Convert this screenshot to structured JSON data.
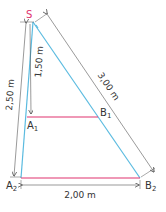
{
  "diagram": {
    "type": "similar-triangles-intercept-theorem",
    "points": {
      "S": {
        "label": "S",
        "x": 33,
        "y": 22
      },
      "A1": {
        "label": "A",
        "sub": "1",
        "x": 27,
        "y": 117
      },
      "B1": {
        "label": "B",
        "sub": "1",
        "x": 98,
        "y": 117
      },
      "A2": {
        "label": "A",
        "sub": "2",
        "x": 21,
        "y": 178
      },
      "B2": {
        "label": "B",
        "sub": "2",
        "x": 140,
        "y": 178
      }
    },
    "dimensions": {
      "SA2": "2,50 m",
      "SA1": "1,50 m",
      "SB2": "3,00 m",
      "A2B2": "2,00 m"
    },
    "colors": {
      "rays": "#5bbbe0",
      "parallels": "#e0336e",
      "label_S": "#e0336e",
      "dimension_lines": "#555555",
      "text": "#333333"
    }
  }
}
